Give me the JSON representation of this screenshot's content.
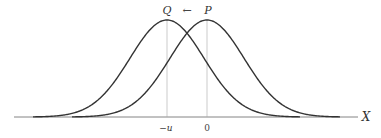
{
  "diagram": {
    "type": "two shifted normal density curves",
    "axis_label": "X",
    "curves": [
      {
        "name": "Q",
        "center_label": "−u",
        "peak_x": 167
      },
      {
        "name": "P",
        "center_label": "0",
        "peak_x": 207
      }
    ],
    "arrow": "←",
    "arrow_direction": "from P toward Q",
    "colors": {
      "curve": "#333333",
      "axis": "#555555",
      "guide": "#aaaaaa"
    }
  },
  "labels": {
    "q": "Q",
    "p": "P",
    "arrow": "←",
    "minus_u": "−u",
    "zero": "0",
    "x_axis": "X"
  }
}
